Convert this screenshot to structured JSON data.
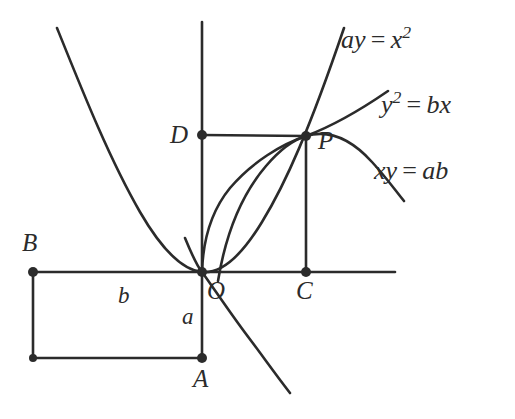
{
  "figure": {
    "kind": "geometry-diagram",
    "background_color": "#ffffff",
    "ink_color": "#2b2b2b",
    "points": [
      {
        "id": "O",
        "label": "O",
        "x": 202,
        "y": 272,
        "label_x": 207,
        "label_y": 278
      },
      {
        "id": "P",
        "label": "P",
        "x": 306,
        "y": 136,
        "label_x": 318,
        "label_y": 128
      },
      {
        "id": "C",
        "label": "C",
        "x": 306,
        "y": 272,
        "label_x": 296,
        "label_y": 278
      },
      {
        "id": "D",
        "label": "D",
        "x": 202,
        "y": 135,
        "label_x": 170,
        "label_y": 122
      },
      {
        "id": "A",
        "label": "A",
        "x": 202,
        "y": 358,
        "label_x": 193,
        "label_y": 366
      },
      {
        "id": "B",
        "label": "B",
        "x": 33,
        "y": 272,
        "label_x": 22,
        "label_y": 230
      }
    ],
    "segment_labels": [
      {
        "id": "b",
        "label": "b",
        "x": 118,
        "y": 284
      },
      {
        "id": "a",
        "label": "a",
        "x": 182,
        "y": 305
      }
    ],
    "curve_labels": [
      {
        "id": "parabola",
        "lhs": "ay",
        "rel": "=",
        "rhs_base": "x",
        "rhs_exp": "2",
        "text": "ay = x2",
        "x": 341,
        "y": 24
      },
      {
        "id": "semicubic",
        "lhs_base": "y",
        "lhs_exp": "2",
        "rel": "=",
        "rhs": "bx",
        "text": "y2 = bx",
        "x": 381,
        "y": 89
      },
      {
        "id": "hyperbola",
        "lhs": "xy",
        "rel": "=",
        "rhs": "ab",
        "text": "xy = ab",
        "x": 374,
        "y": 158
      }
    ],
    "axes": {
      "x_axis": {
        "x1": 33,
        "y1": 272,
        "x2": 395,
        "y2": 272
      },
      "y_axis": {
        "x1": 202,
        "y1": 22,
        "x2": 202,
        "y2": 358
      }
    },
    "segments": [
      {
        "id": "DP",
        "x1": 202,
        "y1": 135,
        "x2": 306,
        "y2": 136
      },
      {
        "id": "PC",
        "x1": 306,
        "y1": 136,
        "x2": 306,
        "y2": 272
      },
      {
        "id": "BO",
        "x1": 33,
        "y1": 272,
        "x2": 202,
        "y2": 272
      },
      {
        "id": "BB2",
        "x1": 33,
        "y1": 272,
        "x2": 33,
        "y2": 358
      },
      {
        "id": "B2A",
        "x1": 33,
        "y1": 358,
        "x2": 202,
        "y2": 358
      },
      {
        "id": "OA",
        "x1": 202,
        "y1": 272,
        "x2": 202,
        "y2": 358
      }
    ]
  }
}
